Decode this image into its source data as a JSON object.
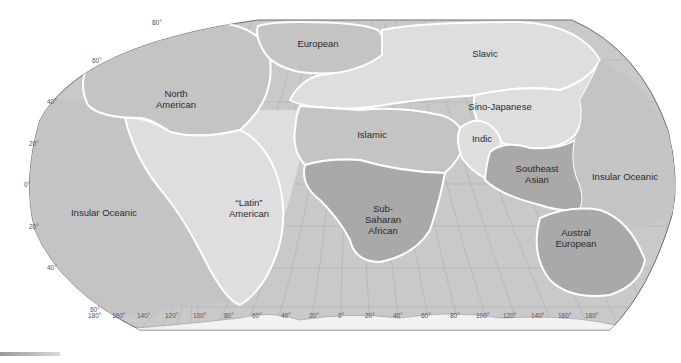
{
  "map": {
    "projection": "Robinson",
    "colors": {
      "background": "#ffffff",
      "ocean": "#c9c9c9",
      "light_region": "#dedede",
      "medium_region": "#c4c4c4",
      "dark_region": "#a9a9a9",
      "boundary": "#ffffff",
      "antarctica": "#f2f2f2"
    },
    "regions": [
      {
        "id": "north-american",
        "label_lines": [
          "North",
          "American"
        ]
      },
      {
        "id": "european",
        "label_lines": [
          "European"
        ]
      },
      {
        "id": "slavic",
        "label_lines": [
          "Slavic"
        ]
      },
      {
        "id": "sino-japanese",
        "label_lines": [
          "Sino-Japanese"
        ]
      },
      {
        "id": "islamic",
        "label_lines": [
          "Islamic"
        ]
      },
      {
        "id": "indic",
        "label_lines": [
          "Indic"
        ]
      },
      {
        "id": "southeast-asian",
        "label_lines": [
          "Southeast",
          "Asian"
        ]
      },
      {
        "id": "insular-oceanic-east",
        "label_lines": [
          "Insular Oceanic"
        ]
      },
      {
        "id": "latin-american",
        "label_lines": [
          "“Latin”",
          "American"
        ]
      },
      {
        "id": "insular-oceanic-west",
        "label_lines": [
          "Insular Oceanic"
        ]
      },
      {
        "id": "sub-saharan-african",
        "label_lines": [
          "Sub-",
          "Saharan",
          "African"
        ]
      },
      {
        "id": "austral-european",
        "label_lines": [
          "Austral",
          "European"
        ]
      }
    ],
    "latitude_labels": [
      "80°",
      "60°",
      "40°",
      "20°",
      "0°",
      "20°",
      "40°",
      "60°"
    ],
    "longitude_labels": [
      "180°",
      "160°",
      "140°",
      "120°",
      "100°",
      "80°",
      "60°",
      "40°",
      "20°",
      "0°",
      "20°",
      "40°",
      "60°",
      "80°",
      "100°",
      "120°",
      "140°",
      "160°",
      "180°"
    ]
  }
}
